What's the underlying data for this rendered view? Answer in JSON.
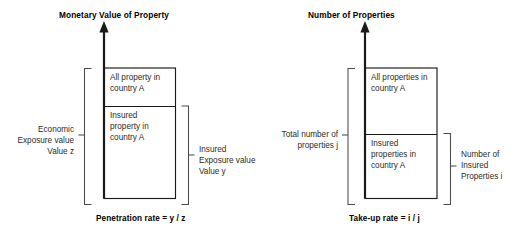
{
  "diagram": {
    "title_hidden": "",
    "panels": [
      {
        "id": "penetration",
        "axis_title": "Monetary Value of Property",
        "axis_arrow_icon": "up-arrow-icon",
        "segments": [
          {
            "id": "all-property",
            "label": "All property in\ncountry A"
          },
          {
            "id": "insured-property",
            "label": "Insured\nproperty in\ncountry A"
          }
        ],
        "left_bracket": {
          "label": "Economic\nExposure value\nValue z",
          "covers": "all-property+insured-property"
        },
        "right_bracket": {
          "label": "Insured\nExposure value\nValue y",
          "covers": "insured-property"
        },
        "caption": "Penetration rate = y / z"
      },
      {
        "id": "take-up",
        "axis_title": "Number of Properties",
        "axis_arrow_icon": "up-arrow-icon",
        "segments": [
          {
            "id": "all-properties",
            "label": "All properties in\ncountry A"
          },
          {
            "id": "insured-properties",
            "label": "Insured\nproperties in\ncountry A"
          }
        ],
        "left_bracket": {
          "label": "Total number of\nproperties j",
          "covers": "all-properties+insured-properties"
        },
        "right_bracket": {
          "label": "Number of\nInsured\nProperties i",
          "covers": "insured-properties"
        },
        "caption": "Take-up rate = i / j"
      }
    ],
    "colors": {
      "stroke": "#1a1a1a",
      "bracket": "#3a3a3a",
      "text": "#2b2b2b",
      "background": "#ffffff"
    }
  }
}
